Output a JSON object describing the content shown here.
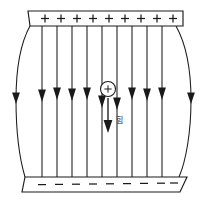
{
  "figure": {
    "title": "Parallel plate capacitor with uniform electric field",
    "width": 207,
    "height": 203,
    "background_color": "#ffffff",
    "ink_color": "#1a1a1a"
  },
  "top_plate": {
    "name": "positively charged plate",
    "charge_sign": "+",
    "charge_count": 9,
    "signs": [
      "+",
      "+",
      "+",
      "+",
      "+",
      "+",
      "+",
      "+",
      "+"
    ],
    "left": 28,
    "right": 183,
    "top": 11,
    "bottom": 26
  },
  "bottom_plate": {
    "name": "negatively charged plate",
    "charge_sign": "−",
    "charge_count": 9,
    "signs": [
      "−",
      "−",
      "−",
      "−",
      "−",
      "−",
      "−",
      "−",
      "−"
    ],
    "left": 22,
    "right": 180,
    "top": 176,
    "bottom": 192
  },
  "field": {
    "direction": "downward",
    "line_count": 11,
    "arrowhead_y": 96,
    "straight_line_x": [
      42,
      57,
      72,
      87,
      102,
      117,
      132,
      147,
      162
    ],
    "fringe_lines": [
      {
        "side": "left",
        "top_x": 30,
        "mid_x": 16,
        "bottom_x": 25
      },
      {
        "side": "right",
        "top_x": 176,
        "mid_x": 192,
        "bottom_x": 179
      }
    ],
    "line_top_y": 26,
    "line_bottom_y": 177
  },
  "test_charge": {
    "label": "+",
    "type": "positive point charge",
    "center_x": 108,
    "center_y": 89,
    "radius": 7.5
  },
  "force_vector": {
    "label": "힘",
    "label_meaning": "force",
    "direction": "down",
    "start_x": 108,
    "start_y": 98,
    "end_y": 133,
    "label_x": 119,
    "label_y": 120
  }
}
